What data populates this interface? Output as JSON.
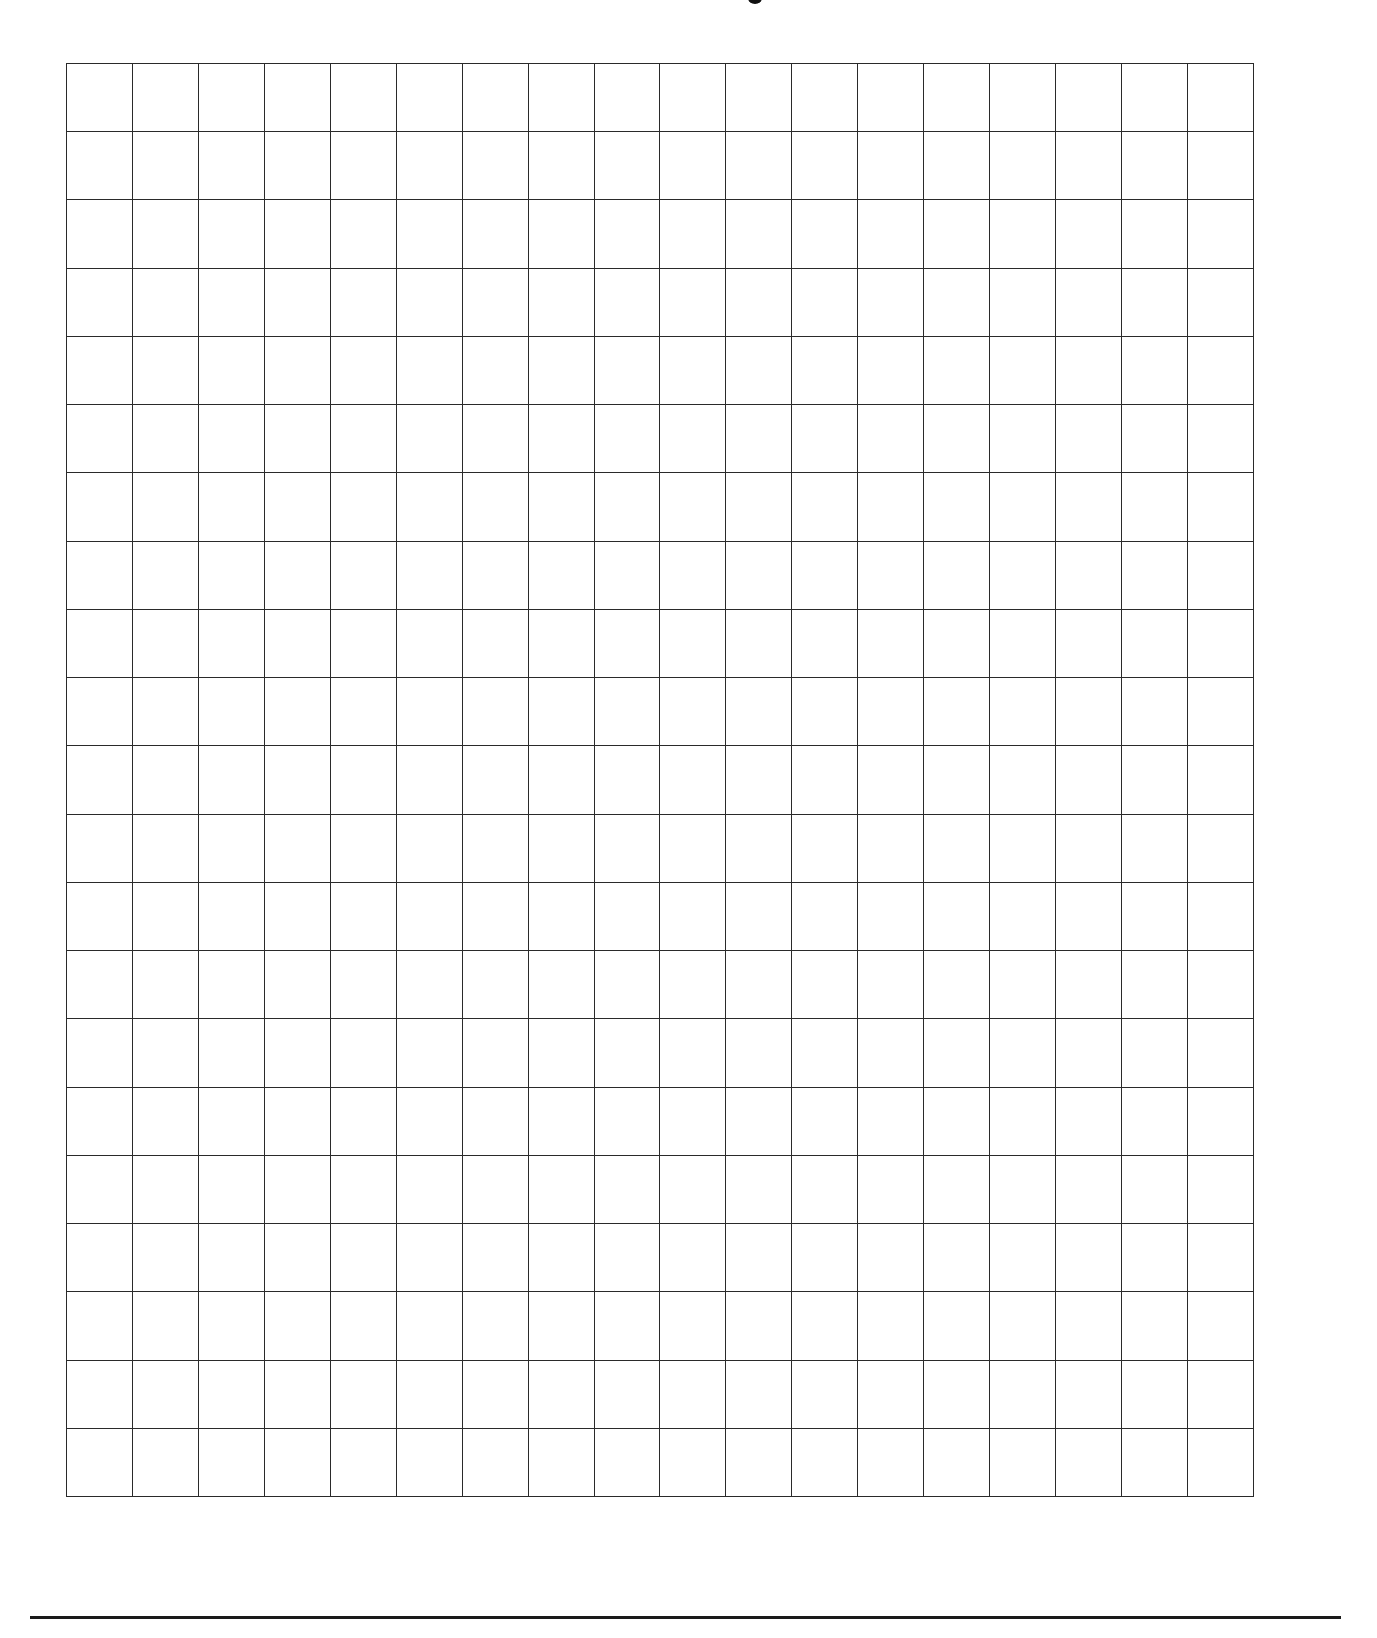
{
  "page": {
    "type": "graph-paper",
    "background_color": "#ffffff",
    "line_color": "#2a2a2a",
    "title_visible": false
  },
  "grid": {
    "columns": 18,
    "rows": 21,
    "left_px": 66,
    "top_px": 63,
    "width_px": 1188,
    "height_px": 1434,
    "cell_width_px": 66,
    "cell_height_px": 68.3
  },
  "footer": {
    "rule_visible": true,
    "rule_color": "#1a1a1a"
  }
}
